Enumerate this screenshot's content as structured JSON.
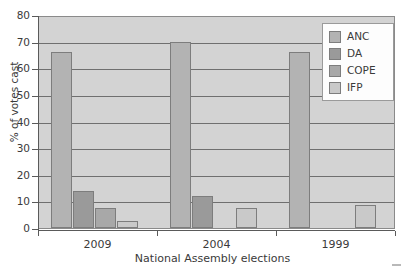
{
  "chart_data": {
    "type": "bar",
    "title": "",
    "xlabel": "National Assembly elections",
    "ylabel": "% of votes cast",
    "categories": [
      "2009",
      "2004",
      "1999"
    ],
    "series": [
      {
        "name": "ANC",
        "color": "#b3b3b3",
        "values": [
          66,
          70,
          66
        ]
      },
      {
        "name": "DA",
        "color": "#9a9a9a",
        "values": [
          14,
          12,
          null
        ]
      },
      {
        "name": "COPE",
        "color": "#a8a8a8",
        "values": [
          7.5,
          null,
          null
        ]
      },
      {
        "name": "IFP",
        "color": "#c9c9c9",
        "values": [
          2.5,
          7.5,
          8.5
        ]
      }
    ],
    "ylim": [
      0,
      80
    ],
    "yticks": [
      0,
      10,
      20,
      30,
      40,
      50,
      60,
      70,
      80
    ],
    "grid": true,
    "legend_position": "top-right",
    "plot_background": "#d3d3d3",
    "gridline_color": "#6f6f6f",
    "axis_color": "#5a5a5a"
  },
  "legend": {
    "items": [
      {
        "label": "ANC"
      },
      {
        "label": "DA"
      },
      {
        "label": "COPE"
      },
      {
        "label": "IFP"
      }
    ]
  }
}
